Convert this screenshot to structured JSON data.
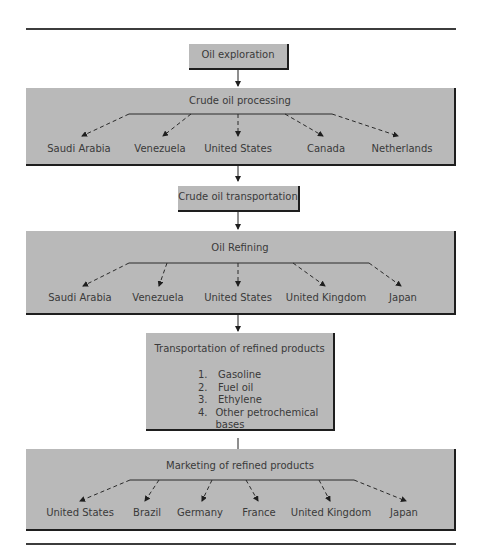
{
  "diagram": {
    "type": "flowchart",
    "steps": [
      {
        "id": "exploration",
        "label": "Oil exploration"
      },
      {
        "id": "processing",
        "label": "Crude oil processing",
        "countries": [
          "Saudi Arabia",
          "Venezuela",
          "United States",
          "Canada",
          "Netherlands"
        ]
      },
      {
        "id": "transport",
        "label": "Crude oil transportation"
      },
      {
        "id": "refining",
        "label": "Oil Refining",
        "countries": [
          "Saudi Arabia",
          "Venezuela",
          "United States",
          "United Kingdom",
          "Japan"
        ]
      },
      {
        "id": "refined_transport",
        "label": "Transportation of refined products",
        "items": [
          {
            "num": "1.",
            "text": "Gasoline"
          },
          {
            "num": "2.",
            "text": "Fuel oil"
          },
          {
            "num": "3.",
            "text": "Ethylene"
          },
          {
            "num": "4.",
            "text": "Other petrochemical bases"
          }
        ]
      },
      {
        "id": "marketing",
        "label": "Marketing of refined products",
        "countries": [
          "United States",
          "Brazil",
          "Germany",
          "France",
          "United Kingdom",
          "Japan"
        ]
      }
    ]
  },
  "colors": {
    "box_fill": "#b9b9b9",
    "shadow": "#1e1e1e",
    "rule": "#3c3c3c"
  }
}
